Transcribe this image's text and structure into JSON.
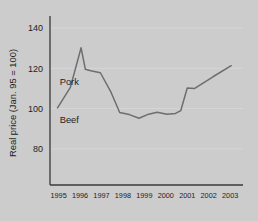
{
  "chart_data": {
    "type": "line",
    "title": "",
    "subtitle": "",
    "xlabel": "",
    "ylabel": "Real price (Jan. 95 = 100)",
    "xlim": [
      1994.6,
      2003.6
    ],
    "ylim": [
      62,
      146
    ],
    "yticks": [
      80,
      100,
      120,
      140
    ],
    "ytick_labels": [
      "80",
      "100",
      "120",
      "140"
    ],
    "xticks": [
      1995,
      1996,
      1997,
      1998,
      1999,
      2000,
      2001,
      2002,
      2003
    ],
    "xtick_labels": [
      "1995",
      "1996",
      "1997",
      "1998",
      "1999",
      "2000",
      "2001",
      "2002",
      "2003"
    ],
    "grid": "horizontal-faint",
    "legend_position": "inline-annotations",
    "line_color": "#6e6e6e",
    "axis_color": "#3a3a3a",
    "background_color": "#cccccc",
    "text_color": "#1d1d1d",
    "annotations": [
      {
        "text": "Pork",
        "x": 1995.05,
        "y": 111.5
      },
      {
        "text": "Beef",
        "x": 1995.05,
        "y": 93.0
      }
    ],
    "series": [
      {
        "name": "Pork",
        "color": "#6e6e6e",
        "x": [
          1994.95,
          1995.55,
          1996.05,
          1996.25,
          1996.5,
          1996.95,
          1997.45,
          1997.85,
          1998.3,
          1998.75,
          1999.2,
          1999.6,
          2000.05,
          2000.45,
          2000.7,
          2001.0,
          2001.35,
          2002.2,
          2003.05
        ],
        "values": [
          100.3,
          110.5,
          130.2,
          119.5,
          118.8,
          117.8,
          108.0,
          98.0,
          97.0,
          95.2,
          97.2,
          98.2,
          97.2,
          97.6,
          99.0,
          110.2,
          110.0,
          115.8,
          121.3
        ]
      }
    ]
  },
  "axis": {
    "ylabel": "Real price (Jan. 95 = 100)"
  }
}
